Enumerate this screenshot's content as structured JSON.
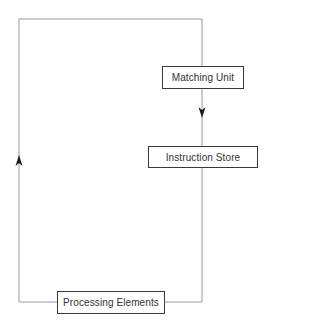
{
  "diagram": {
    "type": "dataflow-cycle",
    "colors": {
      "line": "#9a9a9a",
      "box_border": "#3a3a3a",
      "arrow": "#1a1a1a",
      "text": "#333333",
      "background": "#ffffff"
    },
    "nodes": [
      {
        "id": "matching-unit",
        "label": "Matching Unit"
      },
      {
        "id": "instruction-store",
        "label": "Instruction Store"
      },
      {
        "id": "processing-elements",
        "label": "Processing Elements"
      }
    ],
    "edges": [
      {
        "from": "matching-unit",
        "to": "instruction-store",
        "direction": "down"
      },
      {
        "from": "instruction-store",
        "to": "processing-elements",
        "direction": "down-then-left"
      },
      {
        "from": "processing-elements",
        "to": "matching-unit",
        "direction": "left-up-right-down"
      }
    ],
    "arrows": [
      {
        "name": "down-arrow-icon",
        "location": "between matching unit and instruction store"
      },
      {
        "name": "up-arrow-icon",
        "location": "left return path"
      }
    ]
  }
}
